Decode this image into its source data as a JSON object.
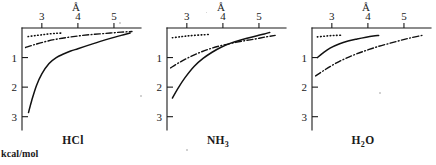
{
  "figure": {
    "y_axis_unit_label": "kcal/mol",
    "x_axis_unit_label": "Å",
    "x_ticks": [
      "3",
      "4",
      "5"
    ],
    "y_ticks": [
      "1",
      "2",
      "3"
    ]
  },
  "chart_data": {
    "type": "line",
    "title": "",
    "xlabel": "Å",
    "ylabel": "kcal/mol",
    "xlim": [
      2.45,
      5.75
    ],
    "ylim": [
      0,
      3.45
    ],
    "y_inverted": true,
    "grid": false,
    "legend": "none",
    "xticks": [
      3,
      4,
      5
    ],
    "yticks": [
      1,
      2,
      3
    ],
    "panels": [
      {
        "label": "HCl",
        "series": [
          {
            "name": "dotted",
            "style": "dotted",
            "x": [
              2.62,
              2.8,
              3.0,
              3.2,
              3.4,
              3.55
            ],
            "y": [
              0.29,
              0.26,
              0.23,
              0.2,
              0.18,
              0.17
            ]
          },
          {
            "name": "dash-dot",
            "style": "dash-dot",
            "x": [
              2.55,
              2.8,
              3.1,
              3.4,
              3.7,
              4.0,
              4.3,
              4.6,
              4.9,
              5.2,
              5.5
            ],
            "y": [
              0.66,
              0.56,
              0.46,
              0.38,
              0.32,
              0.27,
              0.23,
              0.2,
              0.17,
              0.14,
              0.12
            ]
          },
          {
            "name": "solid",
            "style": "solid",
            "x": [
              2.63,
              2.72,
              2.85,
              3.0,
              3.2,
              3.4,
              3.6,
              3.8,
              4.0,
              4.3,
              4.6,
              4.9,
              5.2,
              5.45
            ],
            "y": [
              2.86,
              2.45,
              1.95,
              1.55,
              1.2,
              1.0,
              0.88,
              0.78,
              0.7,
              0.58,
              0.46,
              0.35,
              0.25,
              0.17
            ]
          }
        ]
      },
      {
        "label": "NH3",
        "label_html": "NH<sub>3</sub>",
        "series": [
          {
            "name": "dotted",
            "style": "dotted",
            "x": [
              2.6,
              2.8,
              3.0,
              3.2,
              3.45,
              3.62
            ],
            "y": [
              0.33,
              0.3,
              0.27,
              0.25,
              0.23,
              0.22
            ]
          },
          {
            "name": "dash-dot",
            "style": "dash-dot",
            "x": [
              2.55,
              2.8,
              3.1,
              3.4,
              3.7,
              4.0,
              4.3,
              4.6,
              4.9,
              5.2,
              5.45
            ],
            "y": [
              1.35,
              1.16,
              0.97,
              0.81,
              0.68,
              0.58,
              0.5,
              0.43,
              0.37,
              0.3,
              0.25
            ]
          },
          {
            "name": "solid",
            "style": "solid",
            "x": [
              2.6,
              2.75,
              2.95,
              3.2,
              3.45,
              3.7,
              3.95,
              4.2,
              4.45,
              4.7,
              4.95,
              5.15,
              5.3
            ],
            "y": [
              2.37,
              2.05,
              1.68,
              1.3,
              1.03,
              0.82,
              0.65,
              0.52,
              0.42,
              0.34,
              0.26,
              0.2,
              0.15
            ]
          }
        ]
      },
      {
        "label": "H2O",
        "label_html": "H<sub>2</sub>O",
        "series": [
          {
            "name": "dotted",
            "style": "dotted",
            "x": [
              2.6,
              2.78,
              2.95,
              3.12,
              3.3
            ],
            "y": [
              0.3,
              0.28,
              0.26,
              0.25,
              0.24
            ]
          },
          {
            "name": "dash-dot",
            "style": "dash-dot",
            "x": [
              2.55,
              2.8,
              3.1,
              3.4,
              3.7,
              4.0,
              4.3,
              4.6,
              4.9,
              5.2,
              5.5
            ],
            "y": [
              1.62,
              1.42,
              1.2,
              1.02,
              0.87,
              0.74,
              0.62,
              0.52,
              0.42,
              0.33,
              0.25
            ]
          },
          {
            "name": "solid",
            "style": "solid",
            "x": [
              2.6,
              2.75,
              2.95,
              3.2,
              3.45,
              3.7,
              3.95,
              4.15,
              4.3
            ],
            "y": [
              1.0,
              0.85,
              0.68,
              0.54,
              0.44,
              0.37,
              0.31,
              0.27,
              0.25
            ]
          }
        ]
      }
    ]
  }
}
